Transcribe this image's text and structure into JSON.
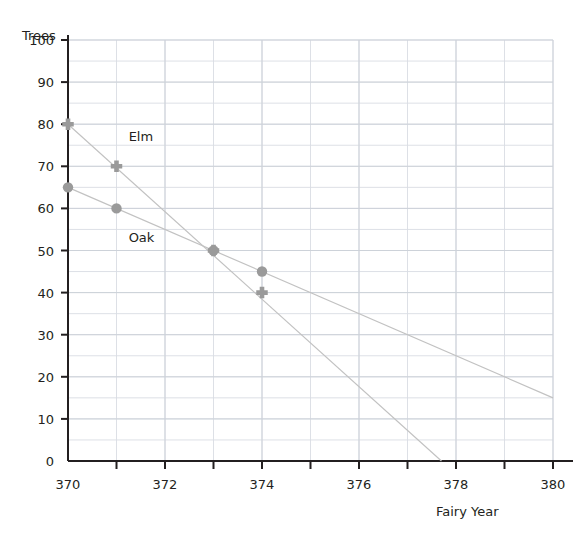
{
  "chart_data": {
    "type": "line",
    "title": "",
    "xlabel": "Fairy Year",
    "ylabel": "Trees",
    "xlim": [
      370,
      380
    ],
    "ylim": [
      0,
      100
    ],
    "xticks": [
      370,
      372,
      374,
      376,
      378,
      380
    ],
    "xtick_labels": [
      "370",
      "372",
      "374",
      "376",
      "378",
      "380"
    ],
    "yticks": [
      0,
      10,
      20,
      30,
      40,
      50,
      60,
      70,
      80,
      90,
      100
    ],
    "ytick_labels": [
      "0",
      "10",
      "20",
      "30",
      "40",
      "50",
      "60",
      "70",
      "80",
      "90",
      "100"
    ],
    "x_minor_step": 1,
    "y_minor_step": 5,
    "grid": true,
    "grid_color": "#d9dde3",
    "axis_color": "#231f20",
    "legend": "inline-labels",
    "series": [
      {
        "name": "Elm",
        "marker": "plus",
        "color": "#9a9a9a",
        "line_color": "#c2c2c2",
        "x": [
          370,
          371,
          373,
          374
        ],
        "values": [
          80,
          70,
          50,
          40
        ],
        "trend_start": [
          370,
          80
        ],
        "trend_end": [
          377.7,
          0
        ],
        "label": "Elm",
        "label_x": 371.25,
        "label_y": 76
      },
      {
        "name": "Oak",
        "marker": "circle",
        "color": "#9a9a9a",
        "line_color": "#c2c2c2",
        "x": [
          370,
          371,
          373,
          374
        ],
        "values": [
          65,
          60,
          50,
          45
        ],
        "trend_start": [
          370,
          65
        ],
        "trend_end": [
          380,
          15
        ],
        "label": "Oak",
        "label_x": 371.25,
        "label_y": 52
      }
    ]
  },
  "labels": {
    "y_axis_title": "Trees",
    "x_axis_title": "Fairy Year"
  }
}
